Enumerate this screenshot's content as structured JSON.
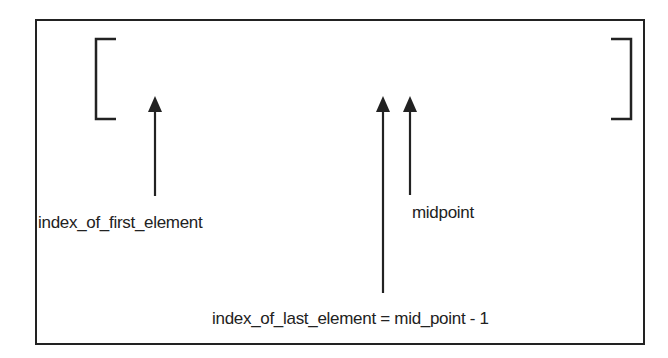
{
  "diagram": {
    "type": "binary-search-subarray",
    "labels": {
      "first": "index_of_first_element",
      "midpoint": "midpoint",
      "last": "index_of_last_element = mid_point - 1"
    },
    "colors": {
      "stroke": "#222222",
      "background": "#ffffff"
    }
  }
}
